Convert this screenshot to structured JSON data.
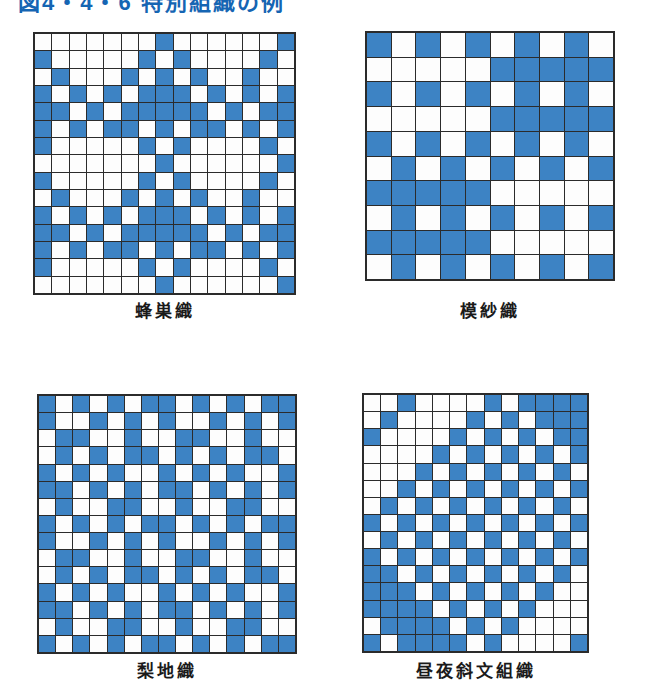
{
  "page": {
    "background": "#ffffff"
  },
  "title": {
    "text": "図4・4・6 特別組織の例",
    "color": "#1565b3",
    "clipped": "true"
  },
  "colors": {
    "filled_cell": "#3D83C4",
    "empty_cell": "#FDFDFD",
    "grid_line": "#2b2b2b"
  },
  "grids": [
    {
      "id": "hachisu-ori",
      "label": "蜂巣織",
      "cols": 15,
      "rows": 15,
      "matrix": [
        "000000010000001",
        "100000101000010",
        "010001010100100",
        "101010111010101",
        "110101111101011",
        "101011010110101",
        "100000101000010",
        "000000010000001",
        "100000101000010",
        "010001010100100",
        "101010111010101",
        "110101111101011",
        "101011010110101",
        "100000101000010",
        "000000010000001"
      ],
      "layout": {
        "left": 33,
        "top": 32,
        "width": 263,
        "height": 263,
        "label_top": 297
      }
    },
    {
      "id": "mosha-ori",
      "label": "模紗織",
      "cols": 10,
      "rows": 10,
      "matrix": [
        "1010101010",
        "0000011111",
        "1010101010",
        "0000011111",
        "1010101010",
        "0101010101",
        "1111100000",
        "0101010101",
        "1111100000",
        "0101010101"
      ],
      "layout": {
        "left": 365,
        "top": 31,
        "width": 250,
        "height": 250,
        "label_top": 297
      }
    },
    {
      "id": "nashiji-ori",
      "label": "梨地織",
      "cols": 15,
      "rows": 15,
      "matrix": [
        "101010110101011",
        "100101010010101",
        "011001001100100",
        "010101101010110",
        "101010010101001",
        "110101011010101",
        "010011001001100",
        "101010110101011",
        "100101010010101",
        "011001001100100",
        "010101101010110",
        "101010010101001",
        "110101011010101",
        "010011001001100",
        "101010110101011"
      ],
      "layout": {
        "left": 37,
        "top": 394,
        "width": 260,
        "height": 260,
        "label_top": 657
      }
    },
    {
      "id": "chuya-shamon",
      "label": "昼夜斜文組織",
      "cols": 13,
      "rows": 15,
      "matrix": [
        "0010000101111",
        "0100001010111",
        "1000010101011",
        "0000101010101",
        "0001010101010",
        "0010101010101",
        "0101010101010",
        "1010101010101",
        "0101010101010",
        "1010101010101",
        "1101010101010",
        "1110101010100",
        "1111010101000",
        "0111101010000",
        "1011110100001"
      ],
      "layout": {
        "left": 362,
        "top": 393,
        "width": 227,
        "height": 260,
        "label_top": 657
      }
    }
  ]
}
